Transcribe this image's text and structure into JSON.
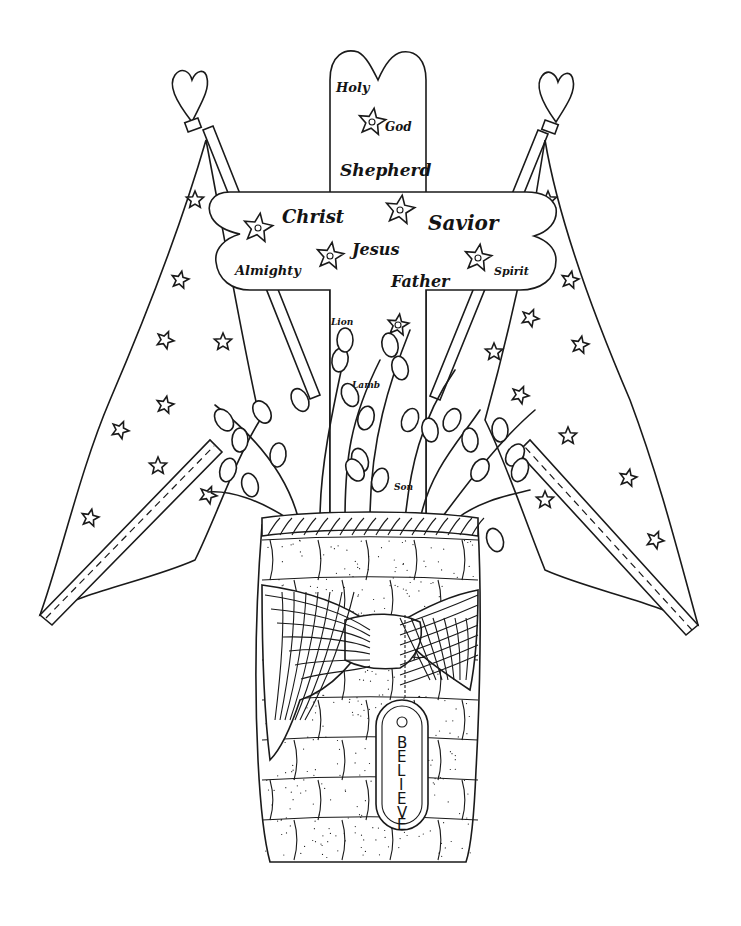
{
  "artwork": {
    "subject": "coloring-page",
    "cross_words": [
      {
        "id": "holy",
        "text": "Holy"
      },
      {
        "id": "god",
        "text": "God"
      },
      {
        "id": "shepherd",
        "text": "Shepherd"
      },
      {
        "id": "christ",
        "text": "Christ"
      },
      {
        "id": "savior",
        "text": "Savior"
      },
      {
        "id": "jesus",
        "text": "Jesus"
      },
      {
        "id": "almighty",
        "text": "Almighty"
      },
      {
        "id": "father",
        "text": "Father"
      },
      {
        "id": "spirit",
        "text": "Spirit"
      },
      {
        "id": "lion",
        "text": "Lion"
      },
      {
        "id": "lamb",
        "text": "Lamb"
      },
      {
        "id": "son",
        "text": "Son"
      }
    ],
    "tag": {
      "letters": [
        "B",
        "E",
        "L",
        "I",
        "E",
        "V",
        "E"
      ]
    },
    "colors": {
      "ink": "#1a1a1a",
      "paper": "#ffffff"
    }
  }
}
